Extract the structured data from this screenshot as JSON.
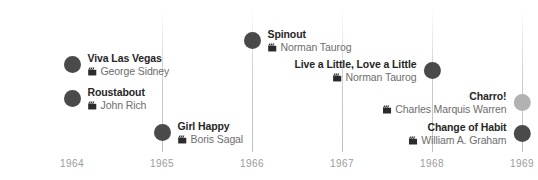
{
  "chart_data": {
    "type": "scatter",
    "title": "",
    "xlabel": "",
    "ylabel": "",
    "grid": true,
    "legend": "none",
    "xlim": [
      1963.5,
      1969.3
    ],
    "axis_ticks": [
      "1964",
      "1965",
      "1966",
      "1967",
      "1968",
      "1969"
    ],
    "categories": [
      "Viva Las Vegas",
      "Roustabout",
      "Girl Happy",
      "Spinout",
      "Live a Little, Love a Little",
      "Charro!",
      "Change of Habit"
    ],
    "series": [
      {
        "name": "Elvis Presley films",
        "points": [
          {
            "title": "Viva Las Vegas",
            "director": "George Sidney",
            "year": 1964.0,
            "color": "#4a4a4a"
          },
          {
            "title": "Roustabout",
            "director": "John Rich",
            "year": 1964.0,
            "color": "#4a4a4a"
          },
          {
            "title": "Girl Happy",
            "director": "Boris Sagal",
            "year": 1965.0,
            "color": "#4a4a4a"
          },
          {
            "title": "Spinout",
            "director": "Norman Taurog",
            "year": 1966.0,
            "color": "#4a4a4a"
          },
          {
            "title": "Live a Little, Love a Little",
            "director": "Norman Taurog",
            "year": 1968.0,
            "color": "#4a4a4a"
          },
          {
            "title": "Charro!",
            "director": "Charles Marquis Warren",
            "year": 1969.0,
            "color": "#b2b2b2"
          },
          {
            "title": "Change of Habit",
            "director": "William A. Graham",
            "year": 1969.0,
            "color": "#4a4a4a"
          }
        ]
      }
    ]
  },
  "axis": {
    "ticks": [
      {
        "label": "1964",
        "x": 72
      },
      {
        "label": "1965",
        "x": 162
      },
      {
        "label": "1966",
        "x": 252
      },
      {
        "label": "1967",
        "x": 342
      },
      {
        "label": "1968",
        "x": 432
      },
      {
        "label": "1969",
        "x": 522
      }
    ],
    "gridline_x": [
      162,
      252,
      342,
      432,
      522
    ]
  },
  "events": [
    {
      "title": "Viva Las Vegas",
      "director": "George Sidney",
      "icon": "clapperboard-icon",
      "dot_color": "#4a4a4a",
      "side": "right",
      "x": 72,
      "y": 61
    },
    {
      "title": "Roustabout",
      "director": "John Rich",
      "icon": "clapperboard-icon",
      "dot_color": "#4a4a4a",
      "side": "right",
      "x": 72,
      "y": 95
    },
    {
      "title": "Girl Happy",
      "director": "Boris Sagal",
      "icon": "clapperboard-icon",
      "dot_color": "#4a4a4a",
      "side": "right",
      "x": 162,
      "y": 129
    },
    {
      "title": "Spinout",
      "director": "Norman Taurog",
      "icon": "clapperboard-icon",
      "dot_color": "#4a4a4a",
      "side": "right",
      "x": 252,
      "y": 37
    },
    {
      "title": "Live a Little, Love a Little",
      "director": "Norman Taurog",
      "icon": "clapperboard-icon",
      "dot_color": "#4a4a4a",
      "side": "left",
      "x": 432,
      "y": 67
    },
    {
      "title": "Charro!",
      "director": "Charles Marquis Warren",
      "icon": "clapperboard-icon",
      "dot_color": "#b2b2b2",
      "side": "left",
      "x": 522,
      "y": 99
    },
    {
      "title": "Change of Habit",
      "director": "William A. Graham",
      "icon": "clapperboard-icon",
      "dot_color": "#4a4a4a",
      "side": "left",
      "x": 522,
      "y": 130
    }
  ]
}
